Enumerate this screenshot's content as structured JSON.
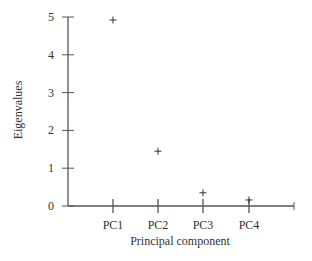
{
  "chart_data": {
    "type": "scatter",
    "title": "",
    "xlabel": "Principal component",
    "ylabel": "Eigenvalues",
    "categories": [
      "PC1",
      "PC2",
      "PC3",
      "PC4"
    ],
    "values": [
      4.92,
      1.45,
      0.35,
      0.16
    ],
    "marker": "+",
    "ylim": [
      0,
      5
    ],
    "yticks": [
      "0",
      "1",
      "2",
      "3",
      "4",
      "5"
    ],
    "grid": false,
    "legend": null
  },
  "colors": {
    "axis": "#555555",
    "marker": "#333333",
    "text": "#333333"
  }
}
